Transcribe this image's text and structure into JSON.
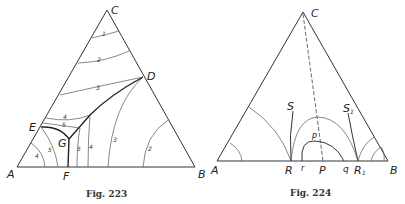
{
  "figures": [
    {
      "caption": "Fig. 223",
      "vertices": {
        "A": "A",
        "B": "B",
        "C": "C"
      },
      "points": {
        "D": "D",
        "E": "E",
        "F": "F",
        "G": "G"
      },
      "isotherm_labels": {
        "top_region": [
          "1",
          "2",
          "3"
        ],
        "upper_left": [
          "4",
          "5"
        ],
        "lower_left": [
          "4",
          "5"
        ],
        "lower_middle": [
          "5",
          "4"
        ],
        "right_region": [
          "3",
          "2"
        ]
      }
    },
    {
      "caption": "Fig. 224",
      "vertices": {
        "A": "A",
        "B": "B",
        "C": "C"
      },
      "points": {
        "R": "R",
        "R1": "R₁",
        "P": "P",
        "S": "S",
        "S1": "S₁",
        "p": "p",
        "r": "r",
        "q": "q"
      }
    }
  ]
}
